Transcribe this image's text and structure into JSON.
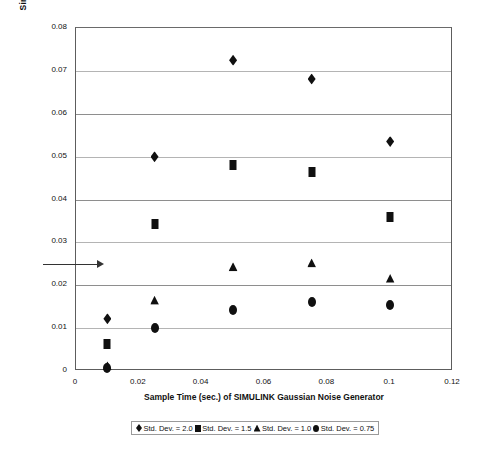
{
  "chart_data": {
    "type": "scatter",
    "title": "",
    "xlabel": "Sample Time (sec.) of SIMULINK Gaussian Noise Generator",
    "ylabel": "Simulation Error Rate (match to Q-function BER of 0.025)",
    "xlim": [
      0,
      0.12
    ],
    "ylim": [
      0,
      0.08
    ],
    "xticks": [
      "0",
      "0.02",
      "0.04",
      "0.06",
      "0.08",
      "0.1",
      "0.12"
    ],
    "xtick_values": [
      0,
      0.02,
      0.04,
      0.06,
      0.08,
      0.1,
      0.12
    ],
    "yticks": [
      "0",
      "0.01",
      "0.02",
      "0.03",
      "0.04",
      "0.05",
      "0.06",
      "0.07",
      "0.08"
    ],
    "ytick_values": [
      0,
      0.01,
      0.02,
      0.03,
      0.04,
      0.05,
      0.06,
      0.07,
      0.08
    ],
    "grid": "horizontal",
    "legend_position": "bottom",
    "x": [
      0.01,
      0.025,
      0.05,
      0.075,
      0.1
    ],
    "series": [
      {
        "name": "Std. Dev. = 2.0",
        "marker": "diamond",
        "color": "#101010",
        "values": [
          0.0122,
          0.05,
          0.0725,
          0.0681,
          0.0535
        ]
      },
      {
        "name": "Std. Dev. = 1.5",
        "marker": "square",
        "color": "#101010",
        "values": [
          0.0062,
          0.0342,
          0.048,
          0.0463,
          0.036
        ]
      },
      {
        "name": "Std. Dev. = 1.0",
        "marker": "triangle",
        "color": "#101010",
        "values": [
          0.0012,
          0.0165,
          0.0243,
          0.0252,
          0.0216
        ]
      },
      {
        "name": "Std. Dev. = 0.75",
        "marker": "circle",
        "color": "#101010",
        "values": [
          0.0008,
          0.01,
          0.0143,
          0.0162,
          0.0155
        ]
      }
    ],
    "annotations": [
      {
        "type": "arrow",
        "label": "",
        "y_value": 0.025,
        "x_start": -0.0105,
        "x_end": 0.0068,
        "direction": "right"
      }
    ]
  },
  "legend": {
    "entries": [
      {
        "marker": "diamond",
        "label": "Std. Dev. = 2.0"
      },
      {
        "marker": "square",
        "label": "Std. Dev. = 1.5"
      },
      {
        "marker": "triangle",
        "label": "Std. Dev. = 1.0"
      },
      {
        "marker": "circle",
        "label": "Std. Dev. = 0.75"
      }
    ]
  }
}
